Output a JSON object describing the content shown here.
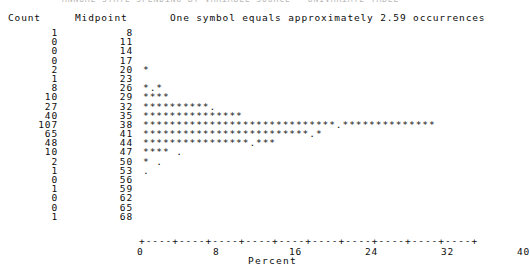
{
  "title_strip": "ANNUAL STATE SPENDING BY VARIABLE SOURCE - UNIVARIATE TABLE",
  "header": {
    "count_label": "Count",
    "midpoint_label": "Midpoint",
    "legend_text": "One symbol equals approximately  2.59 occurrences"
  },
  "axis": {
    "tick_line": "+----+----+----+----+----+----+----+----+----+----+",
    "bar_glyph": "|",
    "xlabel": "Percent",
    "ticklabels": [
      "0",
      "8",
      "16",
      "24",
      "32",
      "40"
    ],
    "tickpositions": [
      0,
      8,
      16,
      24,
      32,
      40
    ]
  },
  "rows": [
    {
      "count": "1",
      "midpoint": "8",
      "stars": ""
    },
    {
      "count": "0",
      "midpoint": "11",
      "stars": ""
    },
    {
      "count": "0",
      "midpoint": "14",
      "stars": ""
    },
    {
      "count": "0",
      "midpoint": "17",
      "stars": ""
    },
    {
      "count": "2",
      "midpoint": "20",
      "stars": "*"
    },
    {
      "count": "1",
      "midpoint": "23",
      "stars": ""
    },
    {
      "count": "8",
      "midpoint": "26",
      "stars": "*.*"
    },
    {
      "count": "10",
      "midpoint": "29",
      "stars": "****"
    },
    {
      "count": "27",
      "midpoint": "32",
      "stars": "**********."
    },
    {
      "count": "40",
      "midpoint": "35",
      "stars": "***************"
    },
    {
      "count": "107",
      "midpoint": "38",
      "stars": "*****************************.**************"
    },
    {
      "count": "65",
      "midpoint": "41",
      "stars": "*************************.*"
    },
    {
      "count": "48",
      "midpoint": "44",
      "stars": "****************.***"
    },
    {
      "count": "10",
      "midpoint": "47",
      "stars": "****   ."
    },
    {
      "count": "2",
      "midpoint": "50",
      "stars": "*  ."
    },
    {
      "count": "1",
      "midpoint": "53",
      "stars": "."
    },
    {
      "count": "0",
      "midpoint": "56",
      "stars": ""
    },
    {
      "count": "1",
      "midpoint": "59",
      "stars": ""
    },
    {
      "count": "0",
      "midpoint": "62",
      "stars": ""
    },
    {
      "count": "0",
      "midpoint": "65",
      "stars": ""
    },
    {
      "count": "1",
      "midpoint": "68",
      "stars": ""
    }
  ],
  "chart_data": {
    "type": "bar",
    "orientation": "horizontal",
    "title": "",
    "xlabel": "Percent",
    "ylabel": "Midpoint",
    "xlim": [
      0,
      40
    ],
    "grid": false,
    "legend_position": "top",
    "symbol_scale": 2.59,
    "symbol_scale_note": "One symbol equals approximately  2.59 occurrences",
    "categories": [
      8,
      11,
      14,
      17,
      20,
      23,
      26,
      29,
      32,
      35,
      38,
      41,
      44,
      47,
      50,
      53,
      56,
      59,
      62,
      65,
      68
    ],
    "values": [
      1,
      0,
      0,
      0,
      2,
      1,
      8,
      10,
      27,
      40,
      107,
      65,
      48,
      10,
      2,
      1,
      0,
      1,
      0,
      0,
      1
    ],
    "series": [
      {
        "name": "Count",
        "values": [
          1,
          0,
          0,
          0,
          2,
          1,
          8,
          10,
          27,
          40,
          107,
          65,
          48,
          10,
          2,
          1,
          0,
          1,
          0,
          0,
          1
        ]
      },
      {
        "name": "Symbols drawn",
        "values": [
          0,
          0,
          0,
          0,
          1,
          0,
          3,
          4,
          11,
          15,
          44,
          27,
          20,
          4,
          1,
          0,
          0,
          0,
          0,
          0,
          0
        ]
      }
    ],
    "total_count": 373,
    "xticks": [
      0,
      8,
      16,
      24,
      32,
      40
    ],
    "xticklabels": [
      "0",
      "8",
      "16",
      "24",
      "32",
      "40"
    ]
  }
}
